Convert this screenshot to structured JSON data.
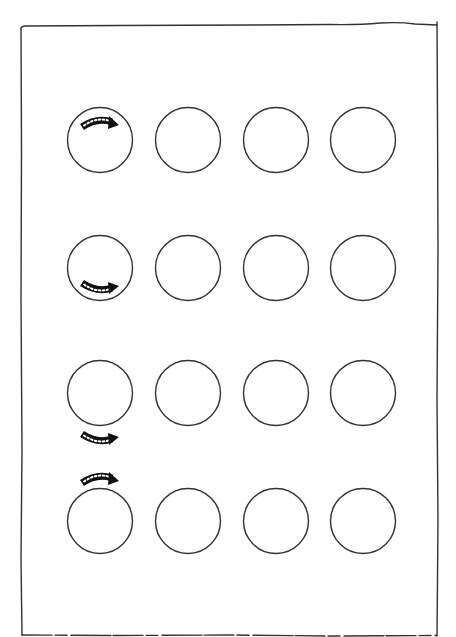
{
  "worksheet": {
    "description": "Hand-drawn framed worksheet with a 4x4 grid of empty circles; first column circles have a curved dotted arrow at different positions",
    "frame": {
      "left": 20,
      "top": 25,
      "right": 438,
      "bottom": 635,
      "stroke": "#333333"
    },
    "circle_style": {
      "radius": 32.5,
      "stroke": "#333333",
      "stroke_width": 1.4,
      "fill": "#ffffff"
    },
    "column_centers_x": [
      100,
      188,
      276,
      363
    ],
    "row_centers_y": [
      140,
      268,
      393,
      521
    ],
    "rows": [
      {
        "label": "row-1",
        "arrow": {
          "position": "inside-top",
          "direction": "clockwise-right",
          "color": "#111111"
        },
        "circles": [
          {
            "id": "r1c1",
            "has_arrow": true
          },
          {
            "id": "r1c2",
            "has_arrow": false
          },
          {
            "id": "r1c3",
            "has_arrow": false
          },
          {
            "id": "r1c4",
            "has_arrow": false
          }
        ]
      },
      {
        "label": "row-2",
        "arrow": {
          "position": "inside-bottom",
          "direction": "counterclockwise-right",
          "color": "#111111"
        },
        "circles": [
          {
            "id": "r2c1",
            "has_arrow": true
          },
          {
            "id": "r2c2",
            "has_arrow": false
          },
          {
            "id": "r2c3",
            "has_arrow": false
          },
          {
            "id": "r2c4",
            "has_arrow": false
          }
        ]
      },
      {
        "label": "row-3",
        "arrow": {
          "position": "outside-bottom",
          "direction": "counterclockwise-right",
          "color": "#111111"
        },
        "circles": [
          {
            "id": "r3c1",
            "has_arrow": true
          },
          {
            "id": "r3c2",
            "has_arrow": false
          },
          {
            "id": "r3c3",
            "has_arrow": false
          },
          {
            "id": "r3c4",
            "has_arrow": false
          }
        ]
      },
      {
        "label": "row-4",
        "arrow": {
          "position": "outside-top",
          "direction": "clockwise-right",
          "color": "#111111"
        },
        "circles": [
          {
            "id": "r4c1",
            "has_arrow": true
          },
          {
            "id": "r4c2",
            "has_arrow": false
          },
          {
            "id": "r4c3",
            "has_arrow": false
          },
          {
            "id": "r4c4",
            "has_arrow": false
          }
        ]
      }
    ]
  }
}
